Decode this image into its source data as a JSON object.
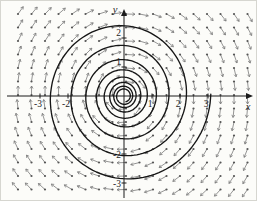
{
  "figure": {
    "background": "#fcfcf9",
    "border_color": "#d6d6d0"
  },
  "chart_data": {
    "type": "line",
    "title": "",
    "xlabel": "x",
    "ylabel": "y",
    "xlim": [
      -4.2,
      4.6
    ],
    "ylim": [
      -3.5,
      3.0
    ],
    "grid": false,
    "legend": "none",
    "x_ticks": [
      {
        "value": -3,
        "label": "-3"
      },
      {
        "value": -2,
        "label": "-2"
      },
      {
        "value": -1,
        "label": ""
      },
      {
        "value": 1,
        "label": "1"
      },
      {
        "value": 2,
        "label": "2"
      },
      {
        "value": 3,
        "label": "3"
      }
    ],
    "y_ticks": [
      {
        "value": 2,
        "label": "2"
      },
      {
        "value": 1,
        "label": "1"
      },
      {
        "value": -1,
        "label": ""
      },
      {
        "value": -2,
        "label": "-2"
      },
      {
        "value": -3,
        "label": "-3"
      }
    ],
    "vector_field": {
      "dx": "y",
      "dy": "-x",
      "rotation": "clockwise",
      "grid_step_px": 13.5,
      "arrow_length_px": 9,
      "color": "#7a7a7a",
      "dot_color": "#565656"
    },
    "spiral": {
      "model": "logarithmic",
      "center_x": 0,
      "center_y": 0,
      "outer_radius_units": 3.1,
      "start_angle_rad": 0.02,
      "per_turn_ratio": 0.72,
      "turns": 8.2,
      "inward_winding": "clockwise",
      "color": "#161616",
      "width_px": 1.35
    },
    "layout": {
      "width": 257,
      "height": 201,
      "origin_px_x": 123,
      "origin_px_y": 95,
      "px_per_unit_x": 28,
      "px_per_unit_y": 29,
      "x_axis_start_px": 6,
      "x_axis_end_px": 252,
      "y_axis_top_px": 8,
      "y_axis_bottom_px": 197,
      "field_x0": 17,
      "field_y0": 13,
      "field_x1": 251,
      "field_y1": 193,
      "axis_color": "#1b1b1b",
      "tick_len_px": 5,
      "label_font_px": 9.5
    }
  }
}
